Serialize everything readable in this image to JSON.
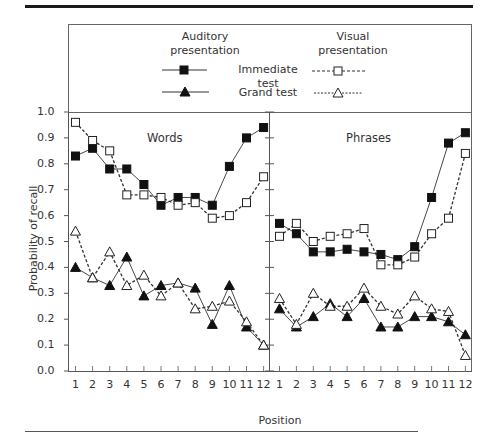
{
  "legend": {
    "auditory_header_line1": "Auditory",
    "auditory_header_line2": "presentation",
    "visual_header_line1": "Visual",
    "visual_header_line2": "presentation",
    "row1_label": "Immediate test",
    "row2_label": "Grand test"
  },
  "axes": {
    "ylabel": "Probability of recall",
    "xlabel": "Position",
    "yticks": [
      "0.0",
      "0.1",
      "0.2",
      "0.3",
      "0.4",
      "0.5",
      "0.6",
      "0.7",
      "0.8",
      "0.9",
      "1.0"
    ],
    "xticks": [
      "1",
      "2",
      "3",
      "4",
      "5",
      "6",
      "7",
      "8",
      "9",
      "10",
      "11",
      "12"
    ]
  },
  "panels": {
    "left_title": "Words",
    "right_title": "Phrases"
  },
  "chart_data": {
    "type": "line",
    "title": "",
    "xlabel": "Position",
    "ylabel": "Probability of recall",
    "ylim": [
      0.0,
      1.0
    ],
    "grid": false,
    "legend_position": "top",
    "x": [
      1,
      2,
      3,
      4,
      5,
      6,
      7,
      8,
      9,
      10,
      11,
      12
    ],
    "panels": [
      {
        "name": "Words",
        "series": [
          {
            "name": "Auditory presentation - Immediate test",
            "marker": "filled-square",
            "line": "solid",
            "values": [
              0.83,
              0.86,
              0.78,
              0.78,
              0.72,
              0.64,
              0.67,
              0.67,
              0.64,
              0.79,
              0.9,
              0.94
            ]
          },
          {
            "name": "Visual presentation - Immediate test",
            "marker": "open-square",
            "line": "dashed",
            "values": [
              0.96,
              0.89,
              0.85,
              0.68,
              0.68,
              0.67,
              0.64,
              0.65,
              0.59,
              0.6,
              0.65,
              0.75
            ]
          },
          {
            "name": "Auditory presentation - Grand test",
            "marker": "filled-triangle",
            "line": "solid",
            "values": [
              0.4,
              0.36,
              0.33,
              0.44,
              0.29,
              0.33,
              0.34,
              0.32,
              0.18,
              0.33,
              0.17,
              0.1
            ]
          },
          {
            "name": "Visual presentation - Grand test",
            "marker": "open-triangle",
            "line": "dashed",
            "values": [
              0.54,
              0.36,
              0.46,
              0.33,
              0.37,
              0.29,
              0.34,
              0.24,
              0.25,
              0.27,
              0.19,
              0.1
            ]
          }
        ]
      },
      {
        "name": "Phrases",
        "series": [
          {
            "name": "Auditory presentation - Immediate test",
            "marker": "filled-square",
            "line": "solid",
            "values": [
              0.57,
              0.53,
              0.46,
              0.46,
              0.47,
              0.46,
              0.45,
              0.43,
              0.48,
              0.67,
              0.88,
              0.92
            ]
          },
          {
            "name": "Visual presentation - Immediate test",
            "marker": "open-square",
            "line": "dashed",
            "values": [
              0.52,
              0.57,
              0.5,
              0.52,
              0.53,
              0.55,
              0.41,
              0.41,
              0.44,
              0.53,
              0.59,
              0.84
            ]
          },
          {
            "name": "Auditory presentation - Grand test",
            "marker": "filled-triangle",
            "line": "solid",
            "values": [
              0.24,
              0.17,
              0.21,
              0.26,
              0.21,
              0.28,
              0.17,
              0.17,
              0.21,
              0.21,
              0.19,
              0.14
            ]
          },
          {
            "name": "Visual presentation - Grand test",
            "marker": "open-triangle",
            "line": "dashed",
            "values": [
              0.28,
              0.18,
              0.3,
              0.25,
              0.25,
              0.32,
              0.25,
              0.22,
              0.29,
              0.24,
              0.23,
              0.06
            ]
          }
        ]
      }
    ]
  }
}
